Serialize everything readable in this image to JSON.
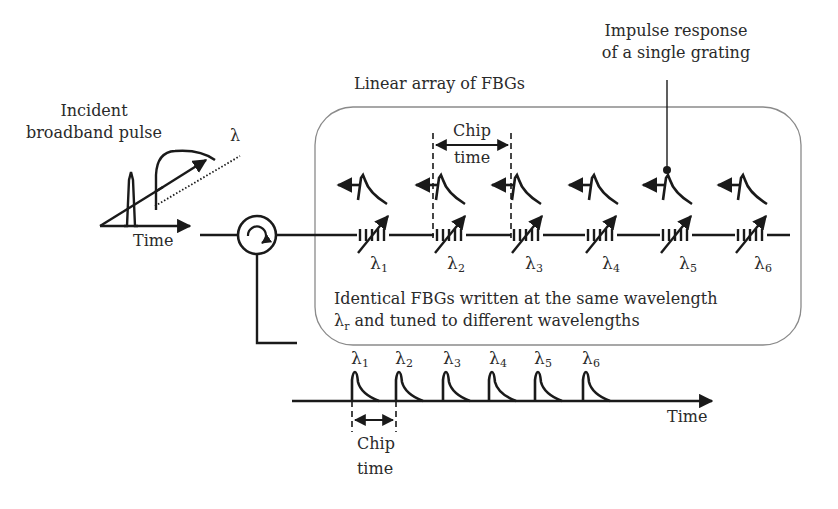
{
  "diagram": {
    "title_array": "Linear array of FBGs",
    "incident": {
      "label_line1": "Incident",
      "label_line2": "broadband pulse",
      "lambda_axis_label": "λ",
      "time_axis_label": "Time"
    },
    "impulse": {
      "label_line1": "Impulse response",
      "label_line2": "of a single grating"
    },
    "chip_time_top": {
      "line1": "Chip",
      "line2": "time"
    },
    "gratings": [
      {
        "symbol": "λ",
        "sub": "1"
      },
      {
        "symbol": "λ",
        "sub": "2"
      },
      {
        "symbol": "λ",
        "sub": "3"
      },
      {
        "symbol": "λ",
        "sub": "4"
      },
      {
        "symbol": "λ",
        "sub": "5"
      },
      {
        "symbol": "λ",
        "sub": "6"
      }
    ],
    "box_note": {
      "line1": "Identical FBGs written at the same wavelength",
      "line2_symbol": "λ",
      "line2_sub": "r",
      "line2_rest": " and tuned to different wavelengths"
    },
    "output": {
      "pulses": [
        {
          "symbol": "λ",
          "sub": "1"
        },
        {
          "symbol": "λ",
          "sub": "2"
        },
        {
          "symbol": "λ",
          "sub": "3"
        },
        {
          "symbol": "λ",
          "sub": "4"
        },
        {
          "symbol": "λ",
          "sub": "5"
        },
        {
          "symbol": "λ",
          "sub": "6"
        }
      ],
      "time_axis_label": "Time",
      "chip_line1": "Chip",
      "chip_line2": "time"
    },
    "colors": {
      "stroke": "#1a1a1a",
      "box_border": "#8a8a8a",
      "text": "#2a2a2a"
    }
  }
}
